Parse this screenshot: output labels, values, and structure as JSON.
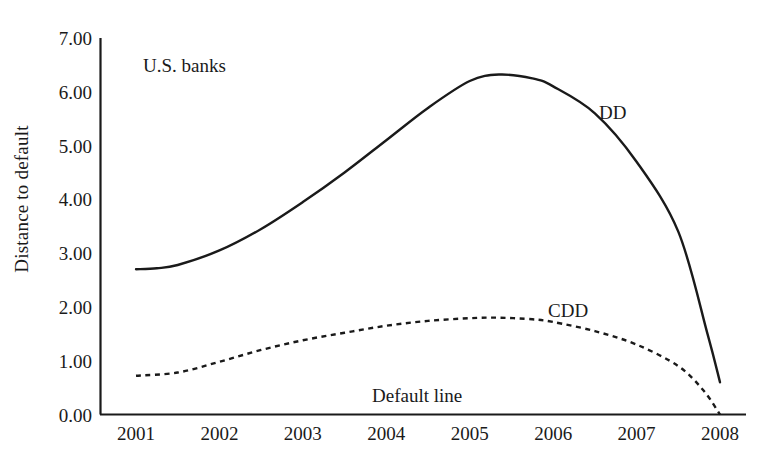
{
  "chart_data": {
    "type": "line",
    "title": "",
    "xlabel": "",
    "ylabel": "Distance to default",
    "xlim": [
      2001,
      2008
    ],
    "ylim": [
      0.0,
      7.0
    ],
    "grid": false,
    "legend": "inline-annotations",
    "categories": [
      "2001",
      "2002",
      "2003",
      "2004",
      "2005",
      "2006",
      "2007",
      "2008"
    ],
    "xticklabels": [
      "2001",
      "2002",
      "2003",
      "2004",
      "2005",
      "2006",
      "2007",
      "2008"
    ],
    "yticklabels": [
      "0.00",
      "1.00",
      "2.00",
      "3.00",
      "4.00",
      "5.00",
      "6.00",
      "7.00"
    ],
    "yticks": [
      0.0,
      1.0,
      2.0,
      3.0,
      4.0,
      5.0,
      6.0,
      7.0
    ],
    "annotations": [
      {
        "id": "us-banks",
        "text": "U.S. banks"
      },
      {
        "id": "dd",
        "text": "DD"
      },
      {
        "id": "cdd",
        "text": "CDD"
      },
      {
        "id": "default-line",
        "text": "Default line"
      }
    ],
    "series": [
      {
        "name": "DD",
        "style": "solid",
        "color": "#1a1a1a",
        "x": [
          2001.0,
          2001.25,
          2001.5,
          2002.0,
          2002.5,
          2003.0,
          2003.5,
          2004.0,
          2004.5,
          2005.0,
          2005.35,
          2005.75,
          2006.0,
          2006.5,
          2007.0,
          2007.5,
          2007.85,
          2008.0
        ],
        "values": [
          2.7,
          2.72,
          2.78,
          3.05,
          3.45,
          3.95,
          4.5,
          5.1,
          5.7,
          6.2,
          6.32,
          6.25,
          6.1,
          5.6,
          4.7,
          3.4,
          1.5,
          0.6
        ]
      },
      {
        "name": "CDD",
        "style": "dashed",
        "color": "#1a1a1a",
        "x": [
          2001.0,
          2001.5,
          2002.0,
          2002.5,
          2003.0,
          2003.5,
          2004.0,
          2004.5,
          2005.0,
          2005.35,
          2005.75,
          2006.0,
          2006.5,
          2007.0,
          2007.5,
          2007.8,
          2008.0
        ],
        "values": [
          0.72,
          0.78,
          0.98,
          1.2,
          1.38,
          1.52,
          1.65,
          1.74,
          1.79,
          1.8,
          1.77,
          1.72,
          1.55,
          1.3,
          0.9,
          0.45,
          0.0
        ]
      }
    ],
    "default_line_value": 0.0,
    "axis_color": "#1a1a1a",
    "background": "#ffffff"
  }
}
